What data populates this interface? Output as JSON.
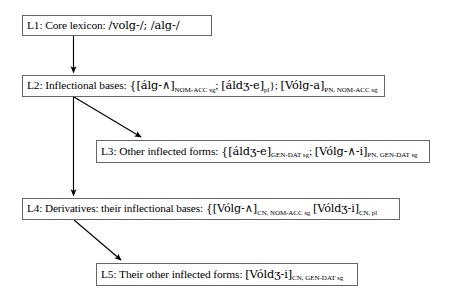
{
  "diagram": {
    "type": "flowchart",
    "background_color": "#ffffff",
    "box_border_color": "#666666",
    "arrow_color": "#000000",
    "nodes": [
      {
        "id": "L1",
        "label": "L1",
        "name": "Core lexicon",
        "text_plain": "L1: Core lexicon: /volg-/; /alg-/",
        "heading": "L1: Core lexicon: ",
        "content": "/volg-/; /alg-/"
      },
      {
        "id": "L2",
        "label": "L2",
        "name": "Inflectional bases",
        "text_plain": "L2: Inflectional bases: {[álg-∧]NOM-ACC sg; [áldʒ-e]pl}; [Vólg-a]PN, NOM-ACC sg",
        "heading": "L2: Inflectional bases: ",
        "entries": [
          {
            "form": "{[álg-∧]",
            "subscript": "NOM-ACC sg",
            "sep": "; "
          },
          {
            "form": "[áldʒ-e]",
            "subscript": "pl",
            "sep": "}; "
          },
          {
            "form": "[Vólg-a]",
            "subscript": "PN, NOM-ACC sg",
            "sep": ""
          }
        ]
      },
      {
        "id": "L3",
        "label": "L3",
        "name": "Other inflected forms",
        "text_plain": "L3: Other inflected forms: {[áldʒ-e]GEN-DAT sg; [Vólg-∧-i]PN, GEN-DAT sg",
        "heading": "L3: Other inflected forms: ",
        "entries": [
          {
            "form": "{[áldʒ-e]",
            "subscript": "GEN-DAT sg",
            "sep": "; "
          },
          {
            "form": "[Vólg-∧-i]",
            "subscript": "PN, GEN-DAT sg",
            "sep": ""
          }
        ]
      },
      {
        "id": "L4",
        "label": "L4",
        "name": "Derivatives: their inflectional bases",
        "text_plain": "L4: Derivatives: their inflectional bases: {[Vólg-∧]CN, NOM-ACC sg [Vóldʒ-i]CN, pl",
        "heading": "L4: Derivatives: their inflectional bases: ",
        "entries": [
          {
            "form": "{[Vólg-∧]",
            "subscript": "CN, NOM-ACC sg",
            "sep": " "
          },
          {
            "form": "[Vóldʒ-i]",
            "subscript": "CN, pl",
            "sep": ""
          }
        ]
      },
      {
        "id": "L5",
        "label": "L5",
        "name": "Their other inflected forms",
        "text_plain": "L5: Their other inflected forms: [Vóldʒ-i]CN, GEN-DAT sg",
        "heading": "L5: Their other inflected forms: ",
        "entries": [
          {
            "form": "[Vóldʒ-i]",
            "subscript": "CN, GEN-DAT sg",
            "sep": ""
          }
        ]
      }
    ],
    "edges": [
      {
        "id": "e1",
        "from": "L1",
        "to": "L2",
        "style": "vertical-arrow"
      },
      {
        "id": "e2",
        "from": "L2",
        "to": "L3",
        "style": "diagonal-arrow"
      },
      {
        "id": "e3",
        "from": "L2",
        "to": "L4",
        "style": "vertical-arrow"
      },
      {
        "id": "e4",
        "from": "L4",
        "to": "L5",
        "style": "diagonal-arrow"
      }
    ]
  }
}
